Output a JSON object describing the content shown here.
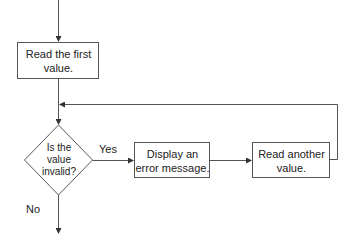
{
  "diagram": {
    "type": "flowchart",
    "colors": {
      "stroke": "#555555",
      "text": "#222222",
      "background": "#ffffff"
    },
    "nodes": [
      {
        "id": "read_first",
        "shape": "rectangle",
        "label": "Read the first\nvalue."
      },
      {
        "id": "is_invalid",
        "shape": "diamond",
        "label": "Is the\nvalue\ninvalid?"
      },
      {
        "id": "display_error",
        "shape": "rectangle",
        "label": "Display an\nerror message."
      },
      {
        "id": "read_another",
        "shape": "rectangle",
        "label": "Read another\nvalue."
      }
    ],
    "edges": [
      {
        "from": "start",
        "to": "read_first",
        "label": ""
      },
      {
        "from": "read_first",
        "to": "is_invalid",
        "label": ""
      },
      {
        "from": "is_invalid",
        "to": "display_error",
        "label": "Yes"
      },
      {
        "from": "display_error",
        "to": "read_another",
        "label": ""
      },
      {
        "from": "read_another",
        "to": "is_invalid",
        "label": ""
      },
      {
        "from": "is_invalid",
        "to": "end",
        "label": "No"
      }
    ],
    "edge_labels": {
      "yes": "Yes",
      "no": "No"
    }
  }
}
